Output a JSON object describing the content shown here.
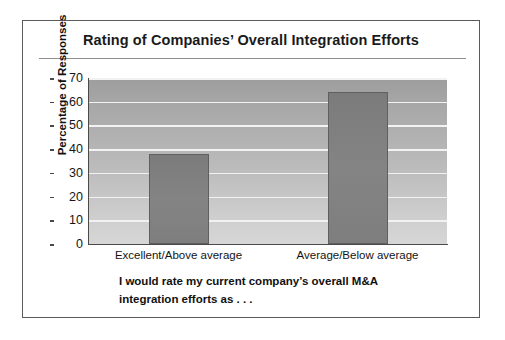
{
  "figure": {
    "title": "Rating of Companies’ Overall Integration Efforts",
    "caption_line1": "I would rate my current company’s overall M&A",
    "caption_line2": "integration efforts as . . ."
  },
  "colors": {
    "frame": "#5b5b5b",
    "bar_fill": "#7d7d7d",
    "bar_edge": "#5f5f5f",
    "gridline": "#f2f2f2",
    "axis": "#4a4a4a",
    "plot_bg_top": "#9d9d9d",
    "plot_bg_bottom": "#d6d6d6",
    "text": "#111111"
  },
  "chart_data": {
    "type": "bar",
    "title": "Rating of Companies’ Overall Integration Efforts",
    "categories": [
      "Excellent/Above average",
      "Average/Below average"
    ],
    "values": [
      38,
      64
    ],
    "xlabel": "",
    "ylabel": "Percentage of Responses",
    "ylim": [
      0,
      70
    ],
    "yticks": [
      0,
      10,
      20,
      30,
      40,
      50,
      60,
      70
    ],
    "ytick_labels": [
      "0",
      "10",
      "20",
      "30",
      "40",
      "50",
      "60",
      "70"
    ],
    "grid": true,
    "grid_axis": "y",
    "legend": false,
    "annotation": "I would rate my current company’s overall M&A integration efforts as . . ."
  }
}
